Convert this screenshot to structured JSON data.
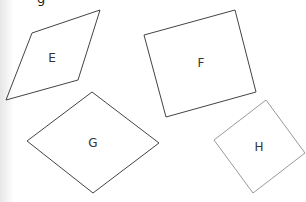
{
  "header": {
    "partial_text": "g"
  },
  "shapes": [
    {
      "id": "E",
      "label": "E",
      "points": "32,33 100,10 78,80 6,100",
      "label_x": 52,
      "label_y": 62,
      "stroke": "#444444"
    },
    {
      "id": "F",
      "label": "F",
      "points": "144,35 235,10 256,92 166,117",
      "label_x": 201,
      "label_y": 67,
      "stroke": "#444444"
    },
    {
      "id": "G",
      "label": "G",
      "points": "92,92 159,143 93,193 27,141",
      "label_x": 93,
      "label_y": 147,
      "stroke": "#444444"
    },
    {
      "id": "H",
      "label": "H",
      "points": "266,100 305,153 253,193 214,140",
      "label_x": 259,
      "label_y": 151,
      "stroke": "#999999"
    }
  ]
}
